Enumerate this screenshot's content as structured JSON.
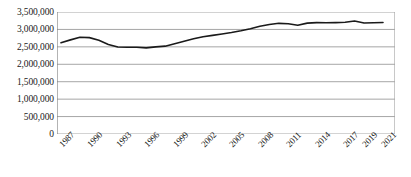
{
  "chart_data": {
    "type": "line",
    "title": "",
    "subtitle": "",
    "xlabel": "",
    "ylabel": "",
    "ylim": [
      0,
      3500000
    ],
    "grid": "horizontal",
    "legend": "none",
    "line_color": "#1a1a1a",
    "gridline_color": "#a6a6a6",
    "axis_color": "#808080",
    "ytick_labels": [
      "3,500,000",
      "3,000,000",
      "2,500,000",
      "2,000,000",
      "1,500,000",
      "1,000,000",
      "500,000",
      "0"
    ],
    "ytick_values": [
      3500000,
      3000000,
      2500000,
      2000000,
      1500000,
      1000000,
      500000,
      0
    ],
    "xtick_labels": [
      "1987",
      "1990",
      "1993",
      "1996",
      "1999",
      "2002",
      "2005",
      "2008",
      "2011",
      "2014",
      "2017",
      "2019",
      "2021"
    ],
    "x": [
      1987,
      1988,
      1989,
      1990,
      1991,
      1992,
      1993,
      1994,
      1995,
      1996,
      1997,
      1998,
      1999,
      2000,
      2001,
      2002,
      2003,
      2004,
      2005,
      2006,
      2007,
      2008,
      2009,
      2010,
      2011,
      2012,
      2013,
      2014,
      2015,
      2016,
      2017,
      2018,
      2019,
      2020,
      2021
    ],
    "values": [
      2620000,
      2700000,
      2775000,
      2765000,
      2690000,
      2570000,
      2495000,
      2490000,
      2490000,
      2470000,
      2500000,
      2520000,
      2590000,
      2660000,
      2730000,
      2790000,
      2830000,
      2870000,
      2910000,
      2960000,
      3020000,
      3090000,
      3140000,
      3175000,
      3165000,
      3120000,
      3180000,
      3195000,
      3190000,
      3195000,
      3205000,
      3240000,
      3185000,
      3190000,
      3200000
    ]
  }
}
